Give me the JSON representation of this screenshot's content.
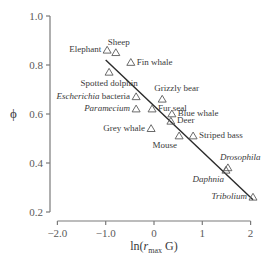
{
  "chart_data": {
    "type": "scatter",
    "title": "",
    "xlabel": "ln(r_max G)",
    "xlabel_parts": {
      "prefix": "ln(",
      "var": "r",
      "sub": "max",
      "suffix": " G)"
    },
    "ylabel": "ϕ",
    "xlim": [
      -2.0,
      2.0
    ],
    "ylim": [
      0.2,
      1.0
    ],
    "x_ticks": [
      -2.0,
      -1.0,
      0,
      1,
      2
    ],
    "x_tick_labels": [
      "−2.0",
      "−1.0",
      "0",
      "1",
      "2"
    ],
    "y_ticks": [
      0.2,
      0.4,
      0.6,
      0.8,
      1.0
    ],
    "y_tick_labels": [
      "0.2",
      "0.4",
      "0.6",
      "0.8",
      "1.0"
    ],
    "grid": false,
    "legend": null,
    "marker": "open-triangle",
    "points": [
      {
        "label": "Elephant",
        "x": -0.97,
        "y": 0.86,
        "italic": false,
        "label_pos": "left"
      },
      {
        "label": "Sheep",
        "x": -0.79,
        "y": 0.85,
        "italic": false,
        "label_pos": "above"
      },
      {
        "label": "Fin whale",
        "x": -0.48,
        "y": 0.81,
        "italic": false,
        "label_pos": "right"
      },
      {
        "label": "Spotted dolphin",
        "x": -0.93,
        "y": 0.77,
        "italic": false,
        "label_pos": "below"
      },
      {
        "label": "Escherichia bacteria",
        "x": -0.37,
        "y": 0.67,
        "italic": "partial",
        "label_pos": "left"
      },
      {
        "label": "Paramecium",
        "x": -0.37,
        "y": 0.62,
        "italic": true,
        "label_pos": "left"
      },
      {
        "label": "Grizzly bear",
        "x": 0.17,
        "y": 0.66,
        "italic": false,
        "label_pos": "above"
      },
      {
        "label": "Fur seal",
        "x": -0.04,
        "y": 0.62,
        "italic": false,
        "label_pos": "right"
      },
      {
        "label": "Blue whale",
        "x": 0.37,
        "y": 0.6,
        "italic": false,
        "label_pos": "right"
      },
      {
        "label": "Deer",
        "x": 0.35,
        "y": 0.57,
        "italic": false,
        "label_pos": "right"
      },
      {
        "label": "Grey whale",
        "x": -0.06,
        "y": 0.54,
        "italic": false,
        "label_pos": "left"
      },
      {
        "label": "Mouse",
        "x": 0.52,
        "y": 0.51,
        "italic": false,
        "label_pos": "below-left"
      },
      {
        "label": "Striped bass",
        "x": 0.81,
        "y": 0.51,
        "italic": false,
        "label_pos": "right"
      },
      {
        "label": "Drosophila",
        "x": 1.53,
        "y": 0.38,
        "italic": true,
        "label_pos": "above"
      },
      {
        "label": "Daphnia",
        "x": 1.49,
        "y": 0.37,
        "italic": true,
        "label_pos": "below-left"
      },
      {
        "label": "Tribolium",
        "x": 2.05,
        "y": 0.26,
        "italic": true,
        "label_pos": "left"
      }
    ],
    "regression_line": {
      "x1": -1.0,
      "y1": 0.82,
      "x2": 2.05,
      "y2": 0.25
    }
  }
}
